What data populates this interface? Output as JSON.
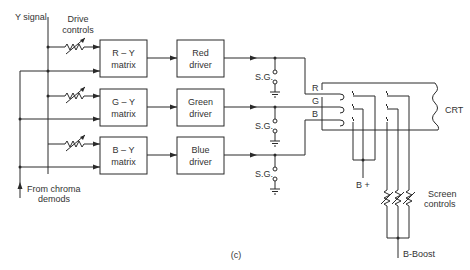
{
  "diagram": {
    "caption": "(c)",
    "inputs": {
      "y_signal": "Y signal",
      "drive_controls_line1": "Drive",
      "drive_controls_line2": "controls",
      "chroma_line1": "From chroma",
      "chroma_line2": "demods"
    },
    "matrices": [
      {
        "line1": "R – Y",
        "line2": "matrix"
      },
      {
        "line1": "G – Y",
        "line2": "matrix"
      },
      {
        "line1": "B – Y",
        "line2": "matrix"
      }
    ],
    "drivers": [
      {
        "line1": "Red",
        "line2": "driver"
      },
      {
        "line1": "Green",
        "line2": "driver"
      },
      {
        "line1": "Blue",
        "line2": "driver"
      }
    ],
    "spark_gaps": [
      "S.G.",
      "S.G.",
      "S.G."
    ],
    "cathodes": [
      "R",
      "G",
      "B"
    ],
    "crt_label": "CRT",
    "b_plus": "B +",
    "screen_controls_line1": "Screen",
    "screen_controls_line2": "controls",
    "b_boost": "B-Boost"
  }
}
